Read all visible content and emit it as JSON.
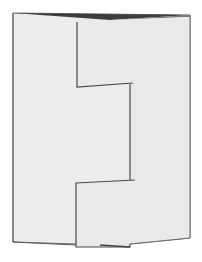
{
  "image": {
    "subject": "folded card with stepped center panel",
    "colors": {
      "background": "#ffffff",
      "paper": "#ebebeb",
      "paper_inner": "#e9e9e9",
      "edge": "#555555",
      "shadow_top": "#3a3a3a"
    }
  }
}
